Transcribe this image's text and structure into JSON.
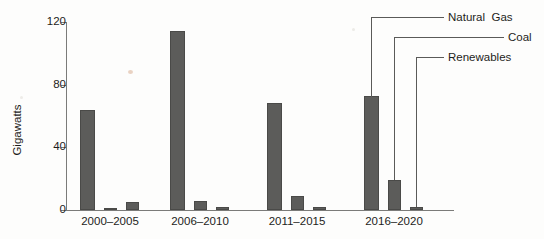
{
  "chart_data": {
    "type": "bar",
    "title": "",
    "subtitle": "",
    "xlabel": "",
    "ylabel": "Gigawatts",
    "ylim": [
      0,
      120
    ],
    "yticks": [
      0,
      40,
      80,
      120
    ],
    "ytick_labels": [
      "0",
      "40",
      "80",
      "120"
    ],
    "grid": false,
    "legend_position": "callout-right",
    "categories": [
      "2000–2005",
      "2006–2010",
      "2011–2015",
      "2016–2020"
    ],
    "series": [
      {
        "name": "Natural  Gas",
        "values": [
          64,
          114,
          68,
          73
        ]
      },
      {
        "name": "Coal",
        "values": [
          1,
          6,
          9,
          19
        ]
      },
      {
        "name": "Renewables",
        "values": [
          5,
          2,
          2,
          2
        ]
      }
    ],
    "bar_color": "#5c5c5a",
    "axis_color": "#7b7b79",
    "text_color": "#1d1d1b",
    "annotations": [
      {
        "label": "Natural  Gas",
        "points_to": "2016–2020 / Natural Gas bar"
      },
      {
        "label": "Coal",
        "points_to": "2016–2020 / Coal bar"
      },
      {
        "label": "Renewables",
        "points_to": "2016–2020 / Renewables bar"
      }
    ]
  },
  "callouts": {
    "natural_gas": "Natural  Gas",
    "coal": "Coal",
    "renewables": "Renewables"
  },
  "axis": {
    "y_title": "Gigawatts",
    "y_labels": [
      "120",
      "80",
      "40",
      "0"
    ],
    "x_labels": [
      "2000–2005",
      "2006–2010",
      "2011–2015",
      "2016–2020"
    ]
  }
}
